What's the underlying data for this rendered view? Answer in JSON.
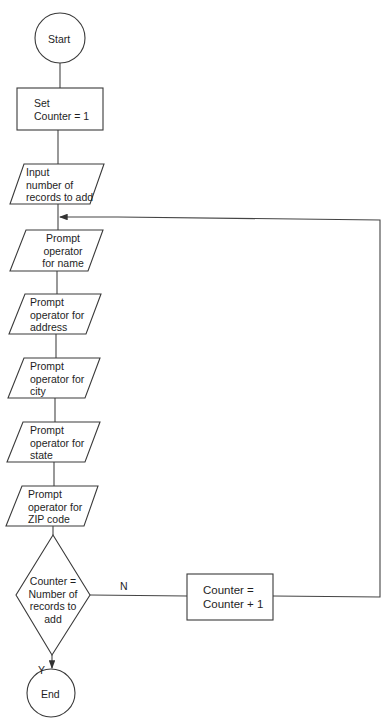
{
  "flowchart": {
    "title": "Add records flowchart",
    "nodes": [
      {
        "id": "start",
        "type": "terminator",
        "label": "Start"
      },
      {
        "id": "set_counter",
        "type": "process",
        "label": "Set\nCounter = 1"
      },
      {
        "id": "input_records",
        "type": "io",
        "label": "Input\nnumber of\nrecords to add"
      },
      {
        "id": "prompt_name",
        "type": "io",
        "label": "Prompt\noperator\nfor name"
      },
      {
        "id": "prompt_address",
        "type": "io",
        "label": "Prompt\noperator for\naddress"
      },
      {
        "id": "prompt_city",
        "type": "io",
        "label": "Prompt\noperator for\ncity"
      },
      {
        "id": "prompt_state",
        "type": "io",
        "label": "Prompt\noperator for\nstate"
      },
      {
        "id": "prompt_zip",
        "type": "io",
        "label": "Prompt\noperator for\nZIP code"
      },
      {
        "id": "decision",
        "type": "decision",
        "label": "Counter =\nNumber of\nrecords to\nadd"
      },
      {
        "id": "increment",
        "type": "process",
        "label": "Counter =\nCounter + 1"
      },
      {
        "id": "end",
        "type": "terminator",
        "label": "End"
      }
    ],
    "edges": [
      {
        "from": "start",
        "to": "set_counter"
      },
      {
        "from": "set_counter",
        "to": "input_records"
      },
      {
        "from": "input_records",
        "to": "prompt_name"
      },
      {
        "from": "prompt_name",
        "to": "prompt_address"
      },
      {
        "from": "prompt_address",
        "to": "prompt_city"
      },
      {
        "from": "prompt_city",
        "to": "prompt_state"
      },
      {
        "from": "prompt_state",
        "to": "prompt_zip"
      },
      {
        "from": "prompt_zip",
        "to": "decision"
      },
      {
        "from": "decision",
        "to": "increment",
        "label": "N"
      },
      {
        "from": "increment",
        "to": "prompt_name"
      },
      {
        "from": "decision",
        "to": "end",
        "label": "Y"
      }
    ],
    "edge_labels": {
      "no": "N",
      "yes": "Y"
    }
  }
}
